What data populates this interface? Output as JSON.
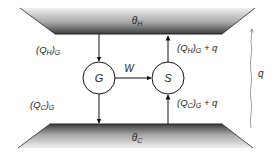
{
  "diagram": {
    "type": "heat-engine-heat-pump-schematic",
    "reservoirs": {
      "hot": {
        "label": "θ",
        "subscript": "H"
      },
      "cold": {
        "label": "θ",
        "subscript": "C"
      }
    },
    "nodes": {
      "generator": {
        "label": "G"
      },
      "pump": {
        "label": "S"
      }
    },
    "work": {
      "label": "W"
    },
    "flows": {
      "qh_g": {
        "main": "(Q",
        "sub1": "H",
        "mid": ")",
        "sub2": "G",
        "suffix": ""
      },
      "qc_g": {
        "main": "(Q",
        "sub1": "C",
        "mid": ")",
        "sub2": "G",
        "suffix": ""
      },
      "qh_s": {
        "main": "(Q",
        "sub1": "H",
        "mid": ")",
        "sub2": "G",
        "suffix": " + q"
      },
      "qc_s": {
        "main": "(Q",
        "sub1": "C",
        "mid": ")",
        "sub2": "G",
        "suffix": " + q"
      }
    },
    "leak": {
      "label": "q"
    },
    "colors": {
      "reservoir_dark": "#4a4a4a",
      "reservoir_light": "#f2f2f2",
      "stroke": "#111111",
      "leak_stroke": "#888888"
    }
  }
}
